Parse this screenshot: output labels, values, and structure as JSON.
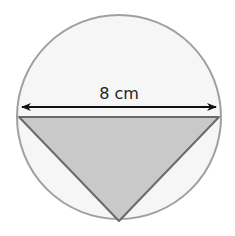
{
  "diagram": {
    "type": "circle with inscribed triangle",
    "dimension_label": "8 cm",
    "shapes": {
      "circle": {
        "cx": 119,
        "cy": 117,
        "r": 102,
        "fill": "#f6f6f6",
        "stroke": "#a0a0a0"
      },
      "triangle": {
        "points": "19,117 219,117 119,221",
        "fill": "#c9c9c9",
        "stroke": "#6a6a6a"
      },
      "arrow": {
        "x1": 20,
        "x2": 218,
        "y": 107,
        "color": "#111111"
      }
    }
  }
}
